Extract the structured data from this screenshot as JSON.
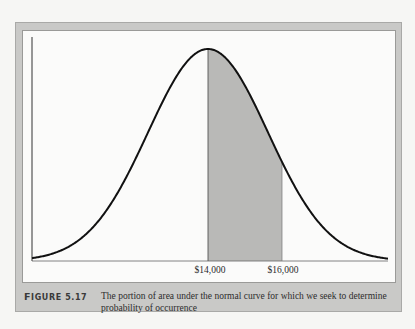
{
  "figure": {
    "label_first": "F",
    "label_rest": "IGURE 5.17",
    "caption": "The portion of area under the normal curve for which we seek to determine probability of occurrence"
  },
  "colors": {
    "frame": "#c9c9c7",
    "panel": "#fbfbfa",
    "curve": "#111111",
    "shaded": "#b9b9b7"
  },
  "chart_data": {
    "type": "area",
    "title": "The portion of area under the normal curve for which we seek to determine probability of occurrence",
    "figure_number": "5.17",
    "distribution": "normal",
    "mean": 14000,
    "xlabel": "",
    "ylabel": "",
    "tick_labels": [
      "$14,000",
      "$16,000"
    ],
    "tick_values": [
      14000,
      16000
    ],
    "shaded_region": {
      "from": 14000,
      "to": 16000
    },
    "grid": false,
    "legend": null
  }
}
